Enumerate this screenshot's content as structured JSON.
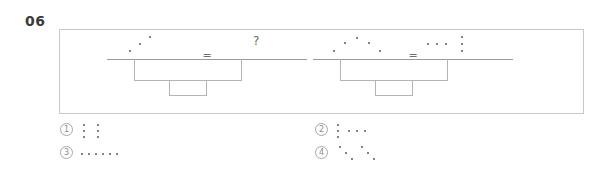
{
  "question": {
    "number": "06",
    "equals_symbol": "=",
    "unknown_symbol": "?"
  },
  "stimulus": {
    "equations": [
      {
        "name": "equation-1",
        "left_term": {
          "name": "dot-pattern-ascending-diagonal-3",
          "dot_count": 3,
          "description": "three dots rising diagonally left-to-right",
          "dots": [
            [
              10,
              20
            ],
            [
              20,
              13
            ],
            [
              30,
              6
            ]
          ]
        },
        "right_term": {
          "name": "unknown-question-mark",
          "dot_count": 0,
          "description": "question mark placeholder",
          "label": "?"
        }
      },
      {
        "name": "equation-2",
        "left_term": {
          "name": "dot-pattern-arch-5",
          "dot_count": 5,
          "description": "five dots forming an arch / inverted V",
          "dots": [
            [
              8,
              20
            ],
            [
              19,
              12
            ],
            [
              31,
              7
            ],
            [
              43,
              12
            ],
            [
              54,
              20
            ]
          ]
        },
        "right_term": {
          "name": "dot-pattern-row3-plus-column3",
          "dot_count": 6,
          "description": "three horizontal dots followed by a vertical column of three dots",
          "dots": [
            [
              4,
              13
            ],
            [
              13,
              13
            ],
            [
              22,
              13
            ],
            [
              38,
              6
            ],
            [
              38,
              13
            ],
            [
              38,
              20
            ]
          ]
        }
      }
    ]
  },
  "options": [
    {
      "name": "option-1",
      "marker": "1",
      "figure_name": "dot-pattern-two-columns-of-3",
      "dot_count": 6,
      "description": "two vertical columns of three dots",
      "dots": [
        [
          4,
          4
        ],
        [
          4,
          10
        ],
        [
          4,
          16
        ],
        [
          18,
          4
        ],
        [
          18,
          10
        ],
        [
          18,
          16
        ]
      ]
    },
    {
      "name": "option-2",
      "marker": "2",
      "figure_name": "dot-pattern-column3-plus-row3",
      "dot_count": 6,
      "description": "a vertical column of three dots followed by three horizontal dots",
      "dots": [
        [
          3,
          4
        ],
        [
          3,
          10
        ],
        [
          3,
          16
        ],
        [
          14,
          10
        ],
        [
          22,
          10
        ],
        [
          30,
          10
        ]
      ]
    },
    {
      "name": "option-3",
      "marker": "3",
      "figure_name": "dot-pattern-horizontal-row-6",
      "dot_count": 6,
      "description": "six dots in a single horizontal row",
      "dots": [
        [
          2,
          10
        ],
        [
          9,
          10
        ],
        [
          16,
          10
        ],
        [
          23,
          10
        ],
        [
          30,
          10
        ],
        [
          37,
          10
        ]
      ]
    },
    {
      "name": "option-4",
      "marker": "4",
      "figure_name": "dot-pattern-two-descending-diagonals",
      "dot_count": 6,
      "description": "two groups of three dots each descending diagonally",
      "dots": [
        [
          5,
          3
        ],
        [
          11,
          9
        ],
        [
          17,
          15
        ],
        [
          27,
          3
        ],
        [
          33,
          9
        ],
        [
          39,
          15
        ]
      ]
    }
  ],
  "colors": {
    "dot": "#5a5a5a",
    "line": "#9a9a9a",
    "panel_border": "#c8c8c8",
    "bracket": "#b4b4b4",
    "marker_text": "#8d8d8d",
    "number_text": "#3b3b3b"
  }
}
